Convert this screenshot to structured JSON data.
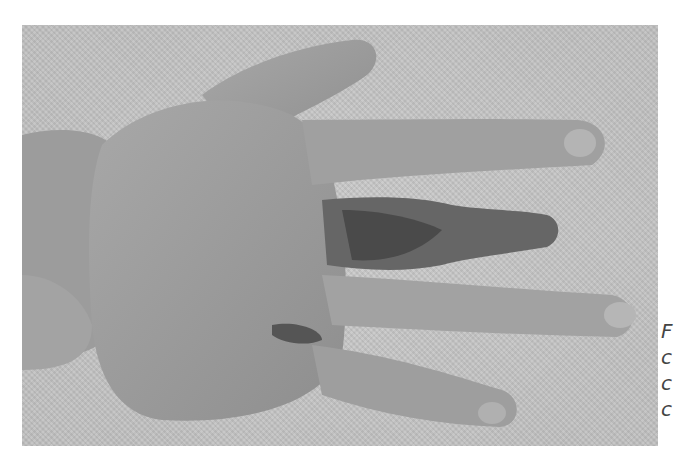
{
  "figure": {
    "image_alt": "Photograph of a hand, dorsal view, with a necrotic, darkened middle finger and bruising across the dorsum",
    "caption_fragments": [
      "F",
      "c",
      "c",
      "c"
    ]
  },
  "colors": {
    "background": "#c9c9c9",
    "skin": "#9a9a9a",
    "lesion": "#4a4a4a"
  }
}
